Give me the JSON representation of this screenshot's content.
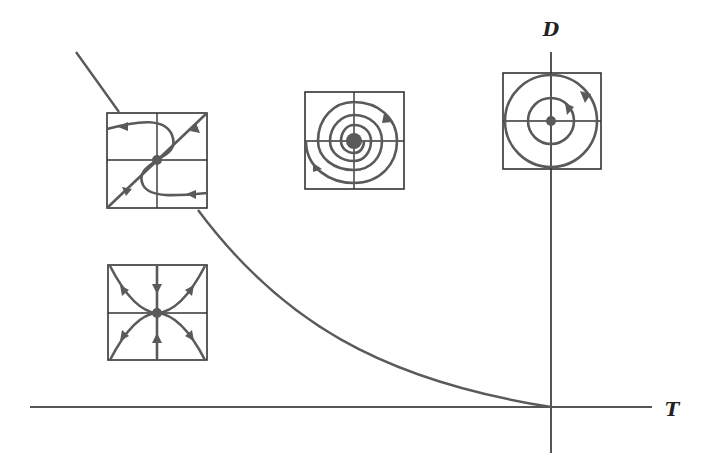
{
  "figure": {
    "type": "trace-determinant phase diagram",
    "axes": {
      "horizontal_label": "T",
      "vertical_label": "D"
    },
    "boundary_curve": "parabola D = T^2/4 (left branch shown)",
    "portraits": [
      {
        "id": "saddle-node-sink",
        "description": "degenerate/inflected trajectories through node, arrows toward center along diagonal",
        "position": "upper-left on parabola"
      },
      {
        "id": "spiral-sink",
        "description": "spiral trajectories converging to center",
        "position": "above parabola, left of D axis"
      },
      {
        "id": "center",
        "description": "closed circular orbits around center",
        "position": "on D axis"
      },
      {
        "id": "node-sink",
        "description": "star/parabolic trajectories converging to center",
        "position": "below parabola, left"
      }
    ],
    "colors": {
      "stroke": "#5a5a5a",
      "box": "#333333",
      "background": "#ffffff"
    }
  }
}
